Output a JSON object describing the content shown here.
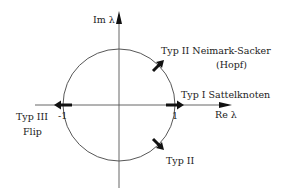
{
  "diagram": {
    "axes": {
      "imaginary_label": "Im λ",
      "real_label": "Re λ",
      "tick_minus_one": "-1",
      "tick_one": "1"
    },
    "annotations": {
      "type2_upper_line1": "Typ II  Neimark-Sacker",
      "type2_upper_line2": "(Hopf)",
      "type1": "Typ I  Sattelknoten",
      "type3_line1": "Typ III",
      "type3_line2": "Flip",
      "type2_lower": "Typ II"
    },
    "colors": {
      "line": "#333333",
      "arrow": "#111111",
      "background": "#ffffff"
    }
  }
}
